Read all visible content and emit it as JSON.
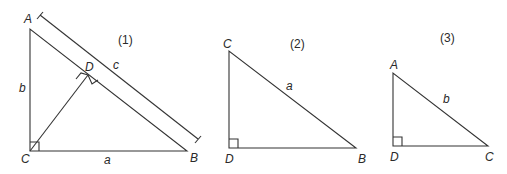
{
  "figures": [
    {
      "id": "1",
      "caption": "(1)",
      "vertices": {
        "A": "A",
        "B": "B",
        "C": "C",
        "D": "D"
      },
      "sides": {
        "a": "a",
        "b": "b",
        "c": "c"
      },
      "right_angles": [
        "C",
        "D"
      ],
      "has_altitude_CD": true,
      "has_dimension_line_c": true
    },
    {
      "id": "2",
      "caption": "(2)",
      "vertices": {
        "C": "C",
        "D": "D",
        "B": "B"
      },
      "sides": {
        "a": "a"
      },
      "right_angles": [
        "D"
      ]
    },
    {
      "id": "3",
      "caption": "(3)",
      "vertices": {
        "A": "A",
        "D": "D",
        "C": "C"
      },
      "sides": {
        "b": "b"
      },
      "right_angles": [
        "D"
      ]
    }
  ],
  "colors": {
    "stroke": "#333333",
    "text": "#2a2a2a",
    "background": "#ffffff"
  }
}
